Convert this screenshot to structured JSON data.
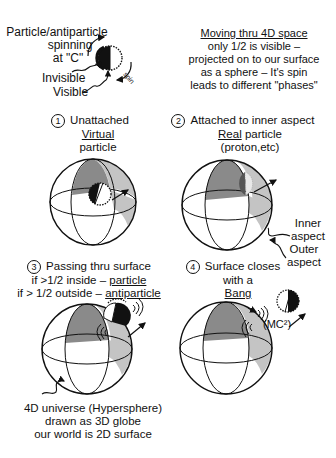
{
  "legend_top_left": {
    "title_line1": "Particle/antiparticle",
    "title_line2": "spinning",
    "title_line3": "at \"C\"",
    "invisible_label": "Invisible",
    "visible_label": "Visible",
    "spin_label": "spin"
  },
  "legend_top_right": {
    "line1": "Moving thru 4D space",
    "line2": "only 1/2 is visible –",
    "line3": "projected on to our surface",
    "line4": "as a sphere – It's spin",
    "line5": "leads to different \"phases\""
  },
  "panels": [
    {
      "number": "1",
      "line1": "Unattached",
      "line2": "Virtual",
      "line3": "particle"
    },
    {
      "number": "2",
      "line1": "Attached to inner aspect",
      "line2a": "Real",
      "line2b": " particle",
      "line3": "(proton,etc)",
      "inner_label_1": "Inner",
      "inner_label_2": "aspect",
      "outer_label_1": "Outer",
      "outer_label_2": "aspect"
    },
    {
      "number": "3",
      "line1": "Passing thru surface",
      "line2a": "if >1/2 inside – ",
      "line2b": "particle",
      "line3a": "if > 1/2 outside – ",
      "line3b": "antiparticle",
      "caption_1": "4D universe (Hypersphere)",
      "caption_2": "drawn as 3D globe",
      "caption_3": "our world is 2D surface"
    },
    {
      "number": "4",
      "line1": "Surface closes",
      "line2": "with a",
      "line3": "Bang",
      "energy_label": "(MC²)"
    }
  ],
  "colors": {
    "ink": "#111111",
    "shade_dark": "#8a8a8a",
    "shade_light": "#c4c4c4",
    "background": "#ffffff"
  }
}
